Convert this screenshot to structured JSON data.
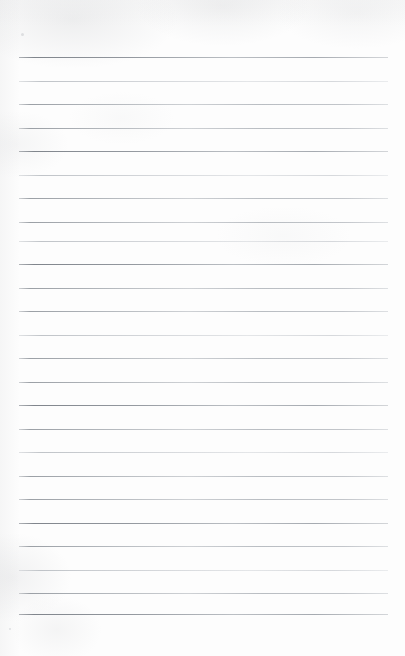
{
  "document": {
    "type": "ruled-notepad-page",
    "title": "Blank lined notepad page",
    "text_content": "",
    "is_blank": true,
    "orientation": "portrait"
  },
  "page": {
    "width": 405,
    "height": 656,
    "background_color": "#fdfdfd",
    "paper_tint": "#f7f7f8"
  },
  "ruling": {
    "line_color": "#b8bcc0",
    "line_thickness_px": 1,
    "line_count": 24,
    "left_margin_px": 19,
    "right_margin_px": 17,
    "line_start_x": 19,
    "line_end_x": 388,
    "first_line_y": 57,
    "last_line_y": 614,
    "line_spacing_px": 23.5,
    "has_vertical_margin_rule": false,
    "has_header_area": true,
    "header_height_px": 57,
    "footer_height_px": 42,
    "lines": [
      {
        "index": 1,
        "y": 57,
        "weight": "dark"
      },
      {
        "index": 2,
        "y": 81,
        "weight": "faint"
      },
      {
        "index": 3,
        "y": 104,
        "weight": "normal"
      },
      {
        "index": 4,
        "y": 128,
        "weight": "normal"
      },
      {
        "index": 5,
        "y": 151,
        "weight": "dark"
      },
      {
        "index": 6,
        "y": 175,
        "weight": "faint"
      },
      {
        "index": 7,
        "y": 198,
        "weight": "normal"
      },
      {
        "index": 8,
        "y": 222,
        "weight": "normal"
      },
      {
        "index": 9,
        "y": 241,
        "weight": "faint"
      },
      {
        "index": 10,
        "y": 264,
        "weight": "dark"
      },
      {
        "index": 11,
        "y": 288,
        "weight": "normal"
      },
      {
        "index": 12,
        "y": 311,
        "weight": "normal"
      },
      {
        "index": 13,
        "y": 335,
        "weight": "faint"
      },
      {
        "index": 14,
        "y": 358,
        "weight": "normal"
      },
      {
        "index": 15,
        "y": 382,
        "weight": "normal"
      },
      {
        "index": 16,
        "y": 405,
        "weight": "dark"
      },
      {
        "index": 17,
        "y": 429,
        "weight": "normal"
      },
      {
        "index": 18,
        "y": 452,
        "weight": "faint"
      },
      {
        "index": 19,
        "y": 476,
        "weight": "normal"
      },
      {
        "index": 20,
        "y": 499,
        "weight": "normal"
      },
      {
        "index": 21,
        "y": 523,
        "weight": "dark"
      },
      {
        "index": 22,
        "y": 546,
        "weight": "normal"
      },
      {
        "index": 23,
        "y": 570,
        "weight": "faint"
      },
      {
        "index": 24,
        "y": 593,
        "weight": "normal"
      },
      {
        "index": 25,
        "y": 614,
        "weight": "dark"
      }
    ]
  },
  "artifacts": {
    "specks": [
      {
        "x": 21,
        "y": 33,
        "size": 3
      },
      {
        "x": 9,
        "y": 628,
        "size": 2
      }
    ]
  }
}
